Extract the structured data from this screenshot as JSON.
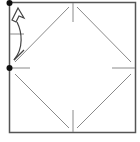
{
  "diagram": {
    "type": "origami-fold-instruction",
    "colors": {
      "outline": "#555555",
      "crease": "#8a8a8a",
      "dot": "#111111",
      "arrow": "#444444",
      "background": "#ffffff"
    },
    "square": {
      "x": 9,
      "y": 2,
      "width": 127,
      "height": 131
    },
    "crease_diamond": "diagonals connecting side midpoints (with small gaps at midpoints)",
    "reference_dots": [
      "top-left-corner",
      "left-edge-midpoint"
    ],
    "arrow": "curved fold arrow from left-edge midpoint up to top-left corner"
  }
}
